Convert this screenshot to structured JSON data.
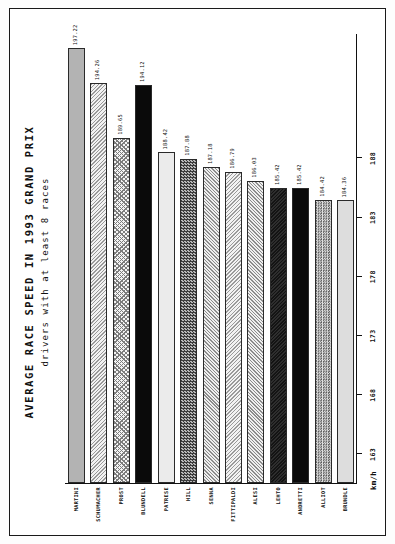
{
  "page": {
    "orientation": "landscape-rotated-90ccw",
    "frame_color": "#1a1a1a",
    "background": "#ffffff"
  },
  "chart_data": {
    "type": "bar",
    "orientation": "horizontal",
    "title": "AVERAGE RACE SPEED IN 1993 GRAND PRIX",
    "subtitle": "drivers with at least 8 races",
    "xlabel": "",
    "ylabel": "km/h",
    "axis_unit": "km/h",
    "grid": false,
    "legend": false,
    "value_axis_ticks": [
      188,
      183,
      178,
      173,
      168,
      163
    ],
    "value_axis_tick_labels": [
      "188",
      "183",
      "178",
      "173",
      "168",
      "163"
    ],
    "value_axis_min": 160.5,
    "value_axis_max": 198.5,
    "categories": [
      "MARTINI",
      "SCHUMACHER",
      "PROST",
      "BLUNDELL",
      "PATRESE",
      "HILL",
      "SENNA",
      "FITTIPALDI",
      "ALESI",
      "LEHTO",
      "ANDRETTI",
      "ALLIOT",
      "BRUNDLE"
    ],
    "values": [
      197.22,
      194.26,
      189.65,
      194.12,
      188.42,
      187.88,
      187.18,
      186.79,
      186.03,
      185.42,
      185.42,
      184.42,
      184.36
    ],
    "value_labels": [
      "197.22",
      "194.26",
      "189.65",
      "194.12",
      "188.42",
      "187.88",
      "187.18",
      "186.79",
      "186.03",
      "185.42",
      "185.42",
      "184.42",
      "184.36"
    ],
    "bar_fills": [
      "fill-grey-flat",
      "fill-diag-light",
      "fill-crosshatch",
      "fill-solid-black",
      "fill-grey-pale",
      "fill-checker-dark",
      "fill-diag-mid",
      "fill-diag-light",
      "fill-diag-mid",
      "fill-dark-hatch",
      "fill-solid-black",
      "fill-checker-mid",
      "fill-grey-light"
    ]
  }
}
